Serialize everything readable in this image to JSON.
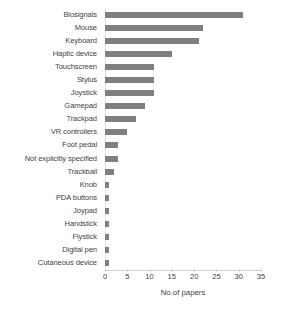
{
  "chart_data": {
    "type": "bar",
    "orientation": "horizontal",
    "title": "",
    "xlabel": "No.of papers",
    "ylabel": "",
    "xlim": [
      0,
      35
    ],
    "xticks": [
      0,
      5,
      10,
      15,
      20,
      25,
      30,
      35
    ],
    "grid": false,
    "legend": null,
    "bar_color": "#7f7f7f",
    "categories": [
      "Biosignals",
      "Mouse",
      "Keyboard",
      "Haptic device",
      "Touchscreen",
      "Stylus",
      "Joystick",
      "Gamepad",
      "Trackpad",
      "VR controllers",
      "Foot pedal",
      "Not explicitly specified",
      "Trackball",
      "Knob",
      "PDA buttons",
      "Joypad",
      "Handstick",
      "Flystick",
      "Digital pen",
      "Cutaneous device"
    ],
    "values": [
      31,
      22,
      21,
      15,
      11,
      11,
      11,
      9,
      7,
      5,
      3,
      3,
      2,
      1,
      1,
      1,
      1,
      1,
      1,
      1
    ]
  },
  "caption": ""
}
